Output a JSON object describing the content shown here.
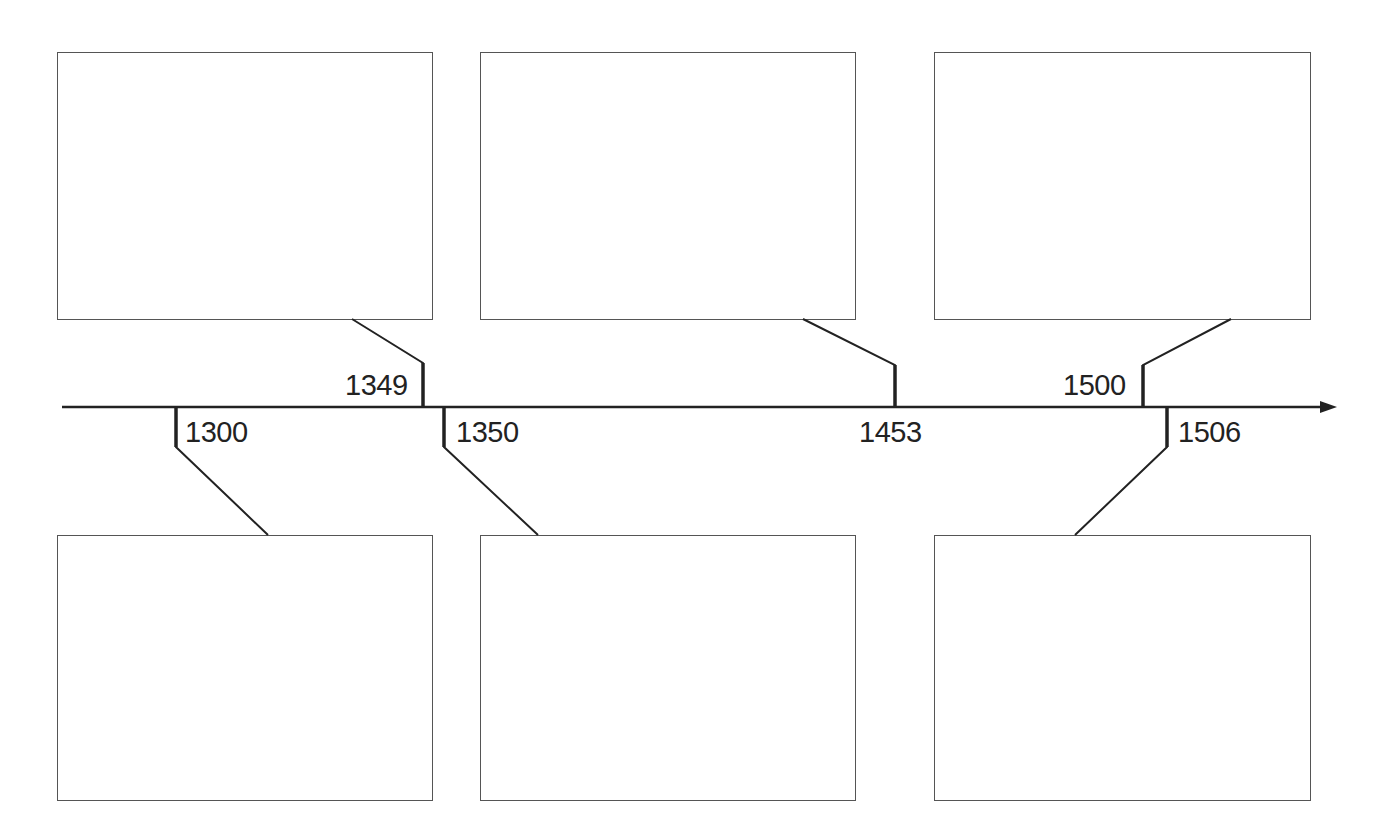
{
  "timeline": {
    "type": "timeline",
    "axis": {
      "direction": "left-to-right",
      "arrow": true,
      "color": "#222222"
    },
    "events": [
      {
        "year": "1300",
        "side": "below",
        "box": 0
      },
      {
        "year": "1349",
        "side": "above",
        "box": 0
      },
      {
        "year": "1350",
        "side": "below",
        "box": 1
      },
      {
        "year": "1453",
        "side": "above",
        "box": 1
      },
      {
        "year": "1500",
        "side": "above",
        "box": 2
      },
      {
        "year": "1506",
        "side": "below",
        "box": 2
      }
    ],
    "boxes": {
      "top": [
        "",
        "",
        ""
      ],
      "bottom": [
        "",
        "",
        ""
      ]
    }
  },
  "labels": {
    "y1300": "1300",
    "y1349": "1349",
    "y1350": "1350",
    "y1453": "1453",
    "y1500": "1500",
    "y1506": "1506"
  }
}
